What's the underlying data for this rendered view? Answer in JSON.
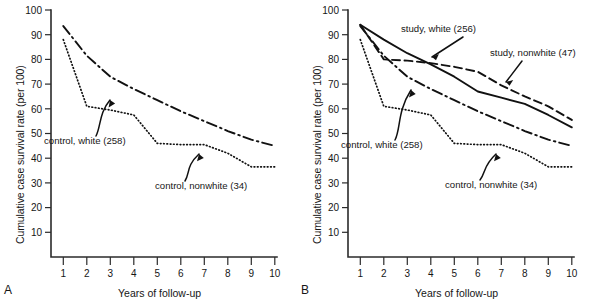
{
  "figure": {
    "panels": [
      {
        "letter": "A",
        "xlabel": "Years of follow-up",
        "ylabel": "Cumulative case survival rate (per 100)"
      },
      {
        "letter": "B",
        "xlabel": "Years of follow-up",
        "ylabel": "Cumulative case survival rate (per 100)"
      }
    ]
  },
  "chart_data": [
    {
      "panel": "A",
      "type": "line",
      "title": "",
      "xlabel": "Years of follow-up",
      "ylabel": "Cumulative case survival rate (per 100)",
      "xlim": [
        0,
        10
      ],
      "ylim": [
        0,
        100
      ],
      "xticks": [
        1,
        2,
        3,
        4,
        5,
        6,
        7,
        8,
        9,
        10
      ],
      "yticks": [
        10,
        20,
        30,
        40,
        50,
        60,
        70,
        80,
        90,
        100
      ],
      "grid": false,
      "legend_position": "inline-annotations",
      "x": [
        1,
        2,
        3,
        4,
        5,
        6,
        7,
        8,
        9,
        10
      ],
      "series": [
        {
          "name": "control, white (258)",
          "style": "dash-dot",
          "values": [
            93.5,
            81.5,
            73.0,
            68.0,
            63.5,
            59.0,
            55.0,
            51.0,
            47.5,
            45.0
          ]
        },
        {
          "name": "control, nonwhite (34)",
          "style": "dotted",
          "values": [
            88.0,
            61.0,
            59.5,
            57.5,
            46.0,
            45.5,
            45.5,
            42.0,
            36.5,
            36.5
          ]
        }
      ],
      "annotations": [
        {
          "text": "control, white (258)",
          "points_to": "dash-dot curve near year 3.3"
        },
        {
          "text": "control, nonwhite (34)",
          "points_to": "dotted curve near year 7.2"
        }
      ]
    },
    {
      "panel": "B",
      "type": "line",
      "title": "",
      "xlabel": "Years of follow-up",
      "ylabel": "Cumulative case survival rate (per 100)",
      "xlim": [
        0,
        10
      ],
      "ylim": [
        0,
        100
      ],
      "xticks": [
        1,
        2,
        3,
        4,
        5,
        6,
        7,
        8,
        9,
        10
      ],
      "yticks": [
        10,
        20,
        30,
        40,
        50,
        60,
        70,
        80,
        90,
        100
      ],
      "grid": false,
      "legend_position": "inline-annotations",
      "x": [
        1,
        2,
        3,
        4,
        5,
        6,
        7,
        8,
        9,
        10
      ],
      "series": [
        {
          "name": "study, white (256)",
          "style": "solid",
          "values": [
            94.0,
            88.0,
            82.5,
            78.0,
            73.0,
            67.0,
            64.5,
            62.0,
            57.5,
            52.5
          ]
        },
        {
          "name": "study, nonwhite (47)",
          "style": "dashed",
          "values": [
            94.0,
            80.0,
            79.5,
            78.5,
            77.0,
            75.0,
            69.5,
            65.0,
            61.0,
            55.5
          ]
        },
        {
          "name": "control, white (258)",
          "style": "dash-dot",
          "values": [
            93.5,
            81.5,
            73.0,
            68.0,
            63.5,
            59.0,
            55.0,
            51.0,
            47.5,
            45.0
          ]
        },
        {
          "name": "control, nonwhite (34)",
          "style": "dotted",
          "values": [
            88.0,
            61.0,
            59.5,
            57.5,
            46.0,
            45.5,
            45.5,
            42.0,
            36.5,
            36.5
          ]
        }
      ],
      "annotations": [
        {
          "text": "study, white (256)",
          "points_to": "solid curve near year 3"
        },
        {
          "text": "study, nonwhite (47)",
          "points_to": "dashed curve near year 7"
        },
        {
          "text": "control, white (258)",
          "points_to": "dash-dot curve near year 3.3"
        },
        {
          "text": "control, nonwhite (34)",
          "points_to": "dotted curve near year 7.2"
        }
      ]
    }
  ]
}
